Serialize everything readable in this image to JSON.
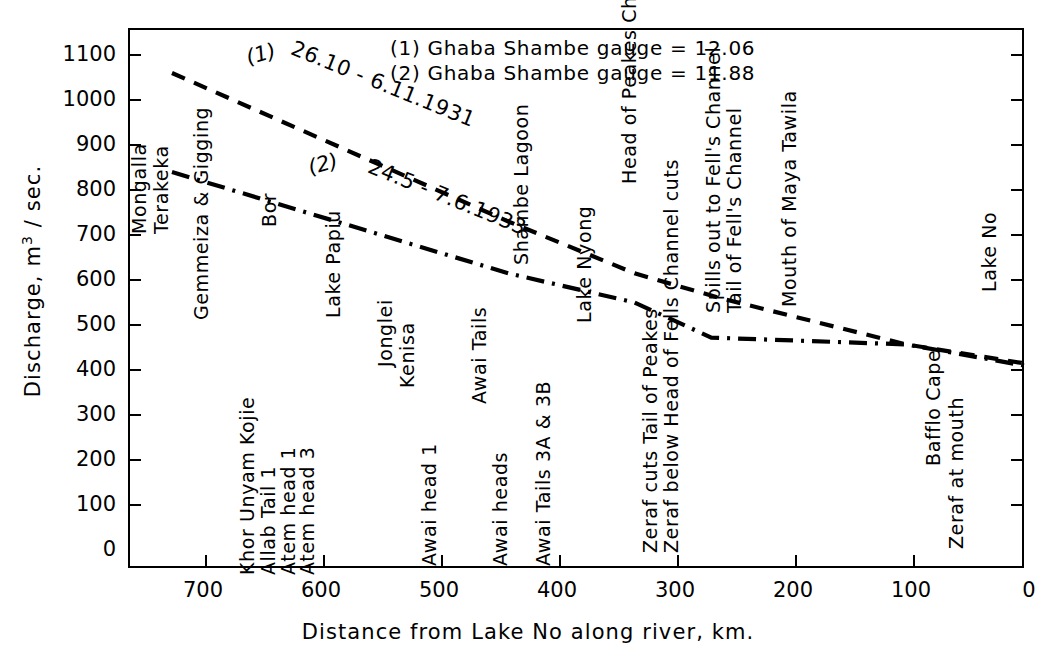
{
  "chart_data": {
    "type": "line",
    "title": "",
    "xlabel": "Distance from Lake No along river, km.",
    "ylabel": "Discharge,  m3 / sec.",
    "xlim": [
      760,
      0
    ],
    "ylim": [
      0,
      1150
    ],
    "x_ticks": [
      700,
      600,
      500,
      400,
      300,
      200,
      100,
      0
    ],
    "y_ticks": [
      0,
      100,
      200,
      300,
      400,
      500,
      600,
      700,
      800,
      900,
      1000,
      1100
    ],
    "grid": false,
    "x_axis_reversed": true,
    "legend_position": "top-center",
    "legend": [
      "(1) Ghaba Shambe gauge = 12.06",
      "(2) Ghaba Shambe gauge = 11.88"
    ],
    "series": [
      {
        "name": "(1)",
        "label": "26.10 - 6.11.1931",
        "linestyle": "dashed",
        "color": "#000000",
        "points": [
          {
            "x": 722,
            "y": 1100
          },
          {
            "x": 437,
            "y": 770
          },
          {
            "x": 330,
            "y": 655
          },
          {
            "x": 258,
            "y": 600
          },
          {
            "x": 100,
            "y": 497
          },
          {
            "x": 0,
            "y": 455
          }
        ]
      },
      {
        "name": "(2)",
        "label": "24.5 - 7.6.1933",
        "linestyle": "dashdot",
        "color": "#000000",
        "points": [
          {
            "x": 722,
            "y": 880
          },
          {
            "x": 437,
            "y": 655
          },
          {
            "x": 330,
            "y": 590
          },
          {
            "x": 265,
            "y": 512
          },
          {
            "x": 100,
            "y": 497
          },
          {
            "x": 0,
            "y": 450
          }
        ]
      }
    ],
    "station_labels": [
      {
        "text": "Mongalla",
        "x": 725
      },
      {
        "text": "Terakeka",
        "x": 710
      },
      {
        "text": "Gemmeiza & Gigging",
        "x": 690
      },
      {
        "text": "Khor Unyam Kojie",
        "x": 630
      },
      {
        "text": "Allab Tail 1",
        "x": 615
      },
      {
        "text": "Atem head 1",
        "x": 602
      },
      {
        "text": "Atem head 3",
        "x": 590
      },
      {
        "text": "Bor",
        "x": 560
      },
      {
        "text": "Lake Papiu",
        "x": 536
      },
      {
        "text": "Jonglei",
        "x": 489
      },
      {
        "text": "Kenisa",
        "x": 474
      },
      {
        "text": "Awai head 1",
        "x": 458
      },
      {
        "text": "Awai Tails",
        "x": 410
      },
      {
        "text": "Awai heads",
        "x": 394
      },
      {
        "text": "Shambe Lagoon",
        "x": 378
      },
      {
        "text": "Awai Tails 3A & 3B",
        "x": 366
      },
      {
        "text": "Lake Nyong",
        "x": 337
      },
      {
        "text": "Head of Peakes Channel",
        "x": 301
      },
      {
        "text": "Zeraf cuts Tail of Peakes",
        "x": 287
      },
      {
        "text": "Zeraf below Head of Fells Channel cuts",
        "x": 272
      },
      {
        "text": "Spills out to Fell's Channel",
        "x": 242
      },
      {
        "text": "Tail of Fell's Channel",
        "x": 228
      },
      {
        "text": "Mouth of Maya Tawila",
        "x": 198
      },
      {
        "text": "Bafflo Cape",
        "x": 66
      },
      {
        "text": "Zeraf at mouth",
        "x": 49
      },
      {
        "text": "Lake No",
        "x": 10
      }
    ]
  },
  "axes": {
    "y_tick_labels": [
      "1100",
      "1000",
      "900",
      "800",
      "700",
      "600",
      "500",
      "400",
      "300",
      "200",
      "100",
      "0"
    ],
    "x_tick_labels": [
      "700",
      "600",
      "500",
      "400",
      "300",
      "200",
      "100",
      "0"
    ],
    "x_title": "Distance from Lake No along river, km.",
    "y_title_pre": "Discharge,  m",
    "y_title_sup": "3",
    "y_title_post": " / sec."
  },
  "legend": {
    "line1": "(1) Ghaba Shambe gauge = 12.06",
    "line2": "(2) Ghaba Shambe gauge = 11.88"
  },
  "annotations": {
    "tag1": "(1)",
    "tag2": "(2)",
    "date1": "26.10 - 6.11.1931",
    "date2": "24.5 - 7.6.1933"
  }
}
